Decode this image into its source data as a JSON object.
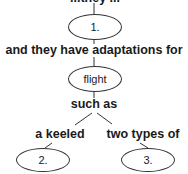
{
  "concept_map": {
    "top_label_cut": "...they ...",
    "node1": "1.",
    "link1": "and they have adaptations for",
    "node_flight": "flight",
    "link2": "such as",
    "branch_left": "a keeled",
    "branch_right": "two types of",
    "node2": "2.",
    "node3": "3."
  }
}
